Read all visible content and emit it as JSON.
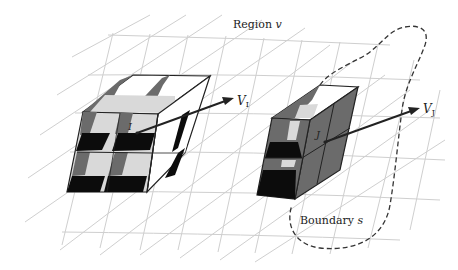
{
  "labels": {
    "region": {
      "text": "Region ",
      "var": "v"
    },
    "boundary": {
      "text": "Boundary ",
      "var": "s"
    },
    "point_i": "I",
    "point_j": "J",
    "vector_i": {
      "main": "V",
      "sub": "I"
    },
    "vector_j": {
      "main": "V",
      "sub": "J"
    }
  },
  "colors": {
    "grid": "#cfcfcf",
    "edge": "#222222",
    "face_dark": "#0c0c0c",
    "face_mid": "#6b6b6b",
    "face_light": "#d9d9d9",
    "face_white": "#ffffff",
    "arrow": "#222222",
    "boundary": "#333333"
  },
  "elements": {
    "left_block": "2x2x2 cell block around point I",
    "right_block": "1x2x2 cell column at boundary around point J"
  }
}
